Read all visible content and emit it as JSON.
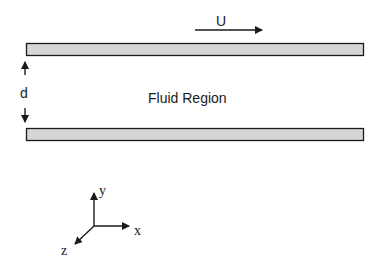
{
  "diagram": {
    "velocity_label": "U",
    "gap_label": "d",
    "region_label": "Fluid Region",
    "axes": {
      "x": "x",
      "y": "y",
      "z": "z"
    },
    "colors": {
      "plate_fill": "#d6d6d6",
      "stroke": "#1a1a1a",
      "background": "#ffffff"
    }
  }
}
